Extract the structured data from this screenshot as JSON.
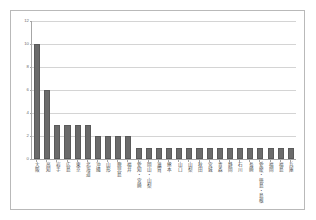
{
  "chart_data": {
    "type": "bar",
    "title": "",
    "subtitle": "",
    "xlabel": "",
    "ylabel": "",
    "ylim": [
      0,
      12
    ],
    "yticks": [
      0,
      2,
      4,
      6,
      8,
      10,
      12
    ],
    "ytick_labels": [
      "0",
      "2",
      "4",
      "6",
      "8",
      "10",
      "12"
    ],
    "grid": true,
    "grid_axis": "y",
    "legend": false,
    "legend_position": "none",
    "bar_color": "#6b6b6b",
    "plot_background": "#ffffff",
    "border_color": "#b9b9b9",
    "gridline_color": "#d4d4d4",
    "axis_color": "#a6a6a6",
    "categories": [
      "大阪",
      "高知",
      "岩手",
      "広島",
      "東京",
      "北海道",
      "沖縄",
      "山形",
      "鹿児島",
      "福井",
      "愛知・宮崎",
      "岡山・山梨",
      "滋賀",
      "熊本",
      "山口",
      "山梨",
      "秋田",
      "宮城",
      "青森",
      "静岡",
      "石川",
      "長崎",
      "愛媛・徳島・島根",
      "福岡",
      "福島",
      "兵庫"
    ],
    "values": [
      10,
      6,
      3,
      3,
      3,
      3,
      2,
      2,
      2,
      2,
      1,
      1,
      1,
      1,
      1,
      1,
      1,
      1,
      1,
      1,
      1,
      1,
      1,
      1,
      1,
      1
    ]
  }
}
